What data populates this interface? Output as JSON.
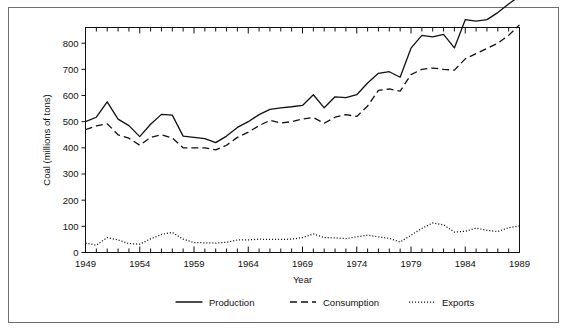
{
  "figure": {
    "background": "#ffffff",
    "frame_color": "#6e6e6e",
    "ink_color": "#111111"
  },
  "chart_data": {
    "type": "line",
    "title": "",
    "xlabel": "Year",
    "ylabel": "Coal (millions of  tons)",
    "xlim": [
      1949,
      1989
    ],
    "ylim": [
      0,
      860
    ],
    "grid": false,
    "legend_position": "bottom",
    "y_ticks": [
      0,
      100,
      200,
      300,
      400,
      500,
      600,
      700,
      800
    ],
    "y_tick_labels": [
      "0",
      "100",
      "200",
      "300",
      "400",
      "500",
      "600",
      "700",
      "800"
    ],
    "x_ticks": [
      1949,
      1954,
      1959,
      1964,
      1969,
      1974,
      1979,
      1984,
      1989
    ],
    "x_tick_labels": [
      "1949",
      "1954",
      "1959",
      "1964",
      "1969",
      "1974",
      "1979",
      "1984",
      "1989"
    ],
    "x_minor_tick_step": 1,
    "x": [
      1949,
      1950,
      1951,
      1952,
      1953,
      1954,
      1955,
      1956,
      1957,
      1958,
      1959,
      1960,
      1961,
      1962,
      1963,
      1964,
      1965,
      1966,
      1967,
      1968,
      1969,
      1970,
      1971,
      1972,
      1973,
      1974,
      1975,
      1976,
      1977,
      1978,
      1979,
      1980,
      1981,
      1982,
      1983,
      1984,
      1985,
      1986,
      1987,
      1988,
      1989
    ],
    "series": [
      {
        "name": "Production",
        "style": "solid",
        "color": "#111111",
        "values": [
          500,
          517,
          576,
          510,
          485,
          443,
          490,
          528,
          525,
          445,
          440,
          435,
          420,
          445,
          478,
          500,
          527,
          547,
          553,
          557,
          562,
          603,
          553,
          595,
          592,
          603,
          648,
          685,
          691,
          670,
          781,
          830,
          824,
          834,
          782,
          890,
          884,
          890,
          917,
          950,
          980
        ]
      },
      {
        "name": "Consumption",
        "style": "dashed",
        "color": "#111111",
        "values": [
          470,
          484,
          492,
          450,
          437,
          410,
          440,
          450,
          438,
          400,
          400,
          400,
          392,
          410,
          440,
          460,
          485,
          505,
          495,
          500,
          510,
          516,
          494,
          517,
          527,
          520,
          560,
          620,
          625,
          617,
          680,
          700,
          705,
          700,
          697,
          740,
          760,
          780,
          800,
          830,
          870
        ]
      },
      {
        "name": "Exports",
        "style": "dotted",
        "color": "#111111",
        "values": [
          36,
          28,
          57,
          48,
          34,
          32,
          52,
          69,
          77,
          51,
          38,
          37,
          36,
          39,
          48,
          48,
          51,
          50,
          50,
          51,
          57,
          71,
          57,
          56,
          53,
          60,
          66,
          60,
          54,
          40,
          66,
          92,
          113,
          106,
          78,
          81,
          93,
          85,
          80,
          95,
          101
        ]
      }
    ]
  },
  "legend": {
    "items": [
      {
        "label": "Production",
        "style": "solid"
      },
      {
        "label": "Consumption",
        "style": "dashed"
      },
      {
        "label": "Exports",
        "style": "dotted"
      }
    ]
  }
}
